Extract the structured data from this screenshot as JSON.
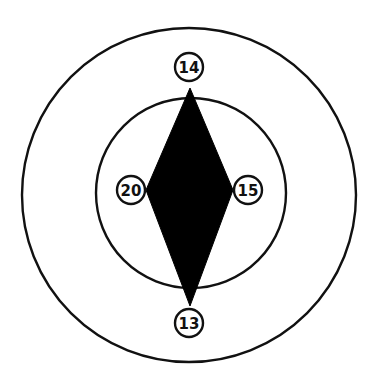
{
  "diagram": {
    "type": "concentric-target-with-diamond",
    "colors": {
      "stroke": "#111111",
      "fill": "#000000",
      "background": "#ffffff"
    },
    "outer_ring": {
      "cx": 189,
      "cy": 195,
      "r": 167
    },
    "inner_ring": {
      "cx": 191,
      "cy": 193,
      "r": 95
    },
    "diamond": {
      "points": [
        [
          190,
          88
        ],
        [
          233,
          190
        ],
        [
          190,
          306
        ],
        [
          146,
          190
        ]
      ]
    },
    "nodes": [
      {
        "id": "top",
        "label": "14",
        "cx": 189,
        "cy": 67,
        "r": 14
      },
      {
        "id": "left",
        "label": "20",
        "cx": 131,
        "cy": 190,
        "r": 14
      },
      {
        "id": "right",
        "label": "15",
        "cx": 248,
        "cy": 190,
        "r": 14
      },
      {
        "id": "bottom",
        "label": "13",
        "cx": 189,
        "cy": 323,
        "r": 14
      }
    ]
  }
}
